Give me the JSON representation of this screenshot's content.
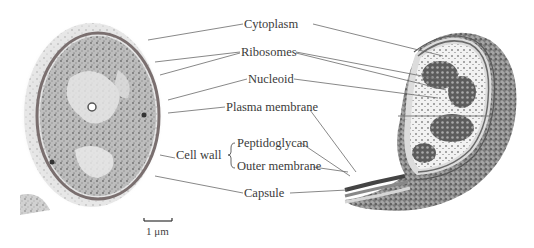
{
  "figure": {
    "left_panel": "Electron micrograph of bacterial cell",
    "right_panel": "Cutaway illustration of bacterial cell",
    "scale_bar": {
      "label": "1 μm"
    }
  },
  "labels": {
    "cytoplasm": "Cytoplasm",
    "ribosomes": "Ribosomes",
    "nucleoid": "Nucleoid",
    "plasma_membrane": "Plasma membrane",
    "cell_wall": "Cell wall",
    "peptidoglycan": "Peptidoglycan",
    "outer_membrane": "Outer membrane",
    "capsule": "Capsule"
  },
  "colors": {
    "background": "#ffffff",
    "text": "#3b3b3b",
    "leader_line": "#6a6a6a",
    "micrograph_dark": "#5a5a5a",
    "micrograph_light": "#d8d8d8"
  }
}
